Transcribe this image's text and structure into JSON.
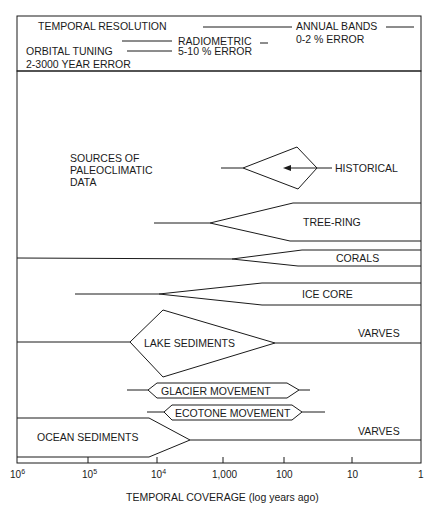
{
  "header": {
    "title": "TEMPORAL RESOLUTION",
    "annual_bands": "ANNUAL BANDS",
    "annual_error": "0-2 % ERROR",
    "radiometric": "RADIOMETRIC",
    "radiometric_error": "5-10 % ERROR",
    "orbital": "ORBITAL TUNING",
    "orbital_error": "2-3000 YEAR ERROR"
  },
  "main": {
    "caption_lines": [
      "SOURCES OF",
      "PALEOCLIMATIC",
      "DATA"
    ],
    "sources": {
      "historical": "HISTORICAL",
      "tree_ring": "TREE-RING",
      "corals": "CORALS",
      "ice_core": "ICE CORE",
      "lake_sediments": "LAKE SEDIMENTS",
      "lake_varves": "VARVES",
      "glacier": "GLACIER MOVEMENT",
      "ecotone": "ECOTONE MOVEMENT",
      "ocean_sediments": "OCEAN SEDIMENTS",
      "ocean_varves": "VARVES"
    }
  },
  "axis": {
    "ticks": [
      {
        "base": "10",
        "exp": "6"
      },
      {
        "base": "10",
        "exp": "5"
      },
      {
        "base": "10",
        "exp": "4"
      },
      {
        "base": "1,000",
        "exp": ""
      },
      {
        "base": "100",
        "exp": ""
      },
      {
        "base": "10",
        "exp": ""
      },
      {
        "base": "1",
        "exp": ""
      }
    ],
    "label": "TEMPORAL COVERAGE (log years ago)"
  }
}
